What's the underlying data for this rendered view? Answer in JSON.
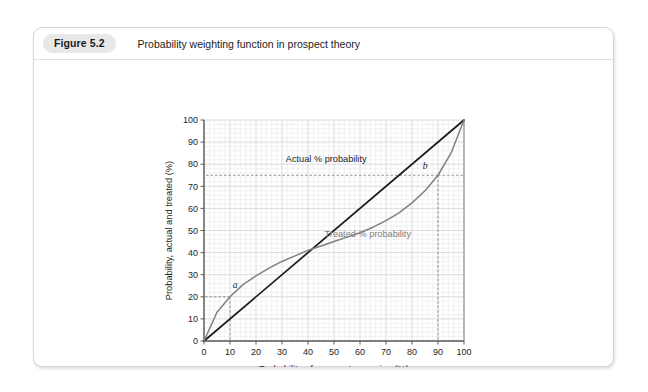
{
  "figure": {
    "badge": "Figure 5.2",
    "caption": "Probability weighting function in prospect theory"
  },
  "chart_data": {
    "type": "line",
    "title": "",
    "xlabel": "Probability of an event occurring (%)",
    "ylabel": "Probability, actual and treated (%)",
    "xlim": [
      0,
      100
    ],
    "ylim": [
      0,
      100
    ],
    "xticks": [
      0,
      10,
      20,
      30,
      40,
      50,
      60,
      70,
      80,
      90,
      100
    ],
    "yticks": [
      0,
      10,
      20,
      30,
      40,
      50,
      60,
      70,
      80,
      90,
      100
    ],
    "grid": true,
    "minor_grid_step": 2,
    "legend": "inline-annotations",
    "series": [
      {
        "name": "Actual % probability",
        "color": "#1a1a1a",
        "label": "Actual % probability",
        "label_x": 47,
        "label_y": 81,
        "x": [
          0,
          100
        ],
        "values": [
          0,
          100
        ]
      },
      {
        "name": "Treated % probability",
        "color": "#808080",
        "label": "Treated % probability",
        "label_x": 63,
        "label_y": 47,
        "x": [
          0,
          5,
          10,
          15,
          20,
          25,
          30,
          35,
          40,
          45,
          50,
          55,
          60,
          65,
          70,
          75,
          80,
          85,
          90,
          95,
          100
        ],
        "values": [
          0,
          13,
          20,
          25.5,
          29.5,
          33,
          36,
          38.5,
          41,
          43,
          45,
          47,
          49,
          51.5,
          54.5,
          58,
          62.5,
          68,
          75,
          85,
          100
        ]
      }
    ],
    "annotations": [
      {
        "label": "a",
        "x": 10,
        "y": 20,
        "label_x": 12,
        "label_y": 24,
        "guide": "dashed"
      },
      {
        "label": "b",
        "x": 90,
        "y": 75,
        "label_x": 85,
        "label_y": 78,
        "guide": "dashed"
      }
    ]
  }
}
